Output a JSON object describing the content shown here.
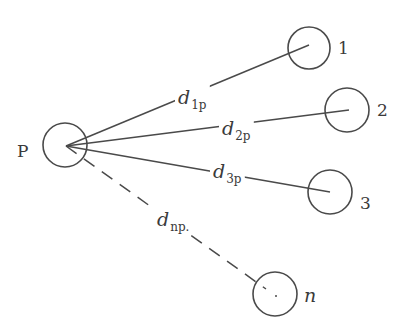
{
  "diagram": {
    "source_node": {
      "label": "P",
      "cx": 65,
      "cy": 145,
      "r": 22,
      "label_x": 17,
      "label_y": 157
    },
    "targets": [
      {
        "id": "1",
        "label": "1",
        "cx": 309,
        "cy": 48,
        "r": 21,
        "label_x": 338,
        "label_y": 54,
        "label_italic": false
      },
      {
        "id": "2",
        "label": "2",
        "cx": 347,
        "cy": 110,
        "r": 22,
        "label_x": 377,
        "label_y": 116,
        "label_italic": false
      },
      {
        "id": "3",
        "label": "3",
        "cx": 330,
        "cy": 192,
        "r": 22,
        "label_x": 360,
        "label_y": 209,
        "label_italic": false
      },
      {
        "id": "n",
        "label": "n",
        "cx": 275,
        "cy": 294,
        "r": 22,
        "label_x": 304,
        "label_y": 302,
        "label_italic": true
      }
    ],
    "edges": [
      {
        "from": "P",
        "to": "1",
        "style": "solid",
        "x1": 66,
        "y1": 146,
        "x2": 309,
        "y2": 45,
        "label_d": "d",
        "label_sub": "1p",
        "label_x": 178,
        "label_y": 104
      },
      {
        "from": "P",
        "to": "2",
        "style": "solid",
        "x1": 66,
        "y1": 146,
        "x2": 349,
        "y2": 110,
        "label_d": "d",
        "label_sub": "2p",
        "label_x": 222,
        "label_y": 135
      },
      {
        "from": "P",
        "to": "3",
        "style": "solid",
        "x1": 66,
        "y1": 146,
        "x2": 330,
        "y2": 192,
        "label_d": "d",
        "label_sub": "3p",
        "label_x": 213,
        "label_y": 178
      },
      {
        "from": "P",
        "to": "n",
        "style": "dashed",
        "x1": 66,
        "y1": 146,
        "x2": 266,
        "y2": 289,
        "label_d": "d",
        "label_sub": "np.",
        "label_x": 157,
        "label_y": 226
      }
    ],
    "colors": {
      "stroke": "#4a4a4a",
      "text": "#3a3a3a",
      "background": "#ffffff"
    }
  }
}
